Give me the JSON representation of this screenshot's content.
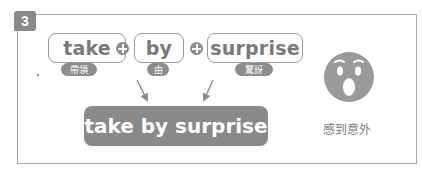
{
  "section_number": "3",
  "words": [
    {
      "text": "take",
      "gloss": "帶領"
    },
    {
      "text": "by",
      "gloss": "由"
    },
    {
      "text": "surprise",
      "gloss": "驚訝"
    }
  ],
  "operator_icon": "plus-circle-icon",
  "result_phrase": "take by surprise",
  "meaning": "感到意外",
  "illustration_icon": "surprised-face-icon",
  "colors": {
    "accent_gray": "#8a8a8a",
    "border_gray": "#a8a8a8",
    "text_gray": "#7a7a7a",
    "background": "#ffffff"
  }
}
